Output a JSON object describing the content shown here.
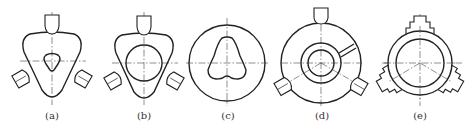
{
  "figure": {
    "panels": [
      {
        "id": "a",
        "label": "(a)",
        "description": "Rounded triangular workpiece with triangular hole held by three jaws"
      },
      {
        "id": "b",
        "label": "(b)",
        "description": "Rounded triangular workpiece with circular bore held by three jaws"
      },
      {
        "id": "c",
        "label": "(c)",
        "description": "Circular workpiece with pear-shaped cam profile"
      },
      {
        "id": "d",
        "label": "(d)",
        "description": "Circular ring workpiece with concentric bore and radial slot held by three jaws"
      },
      {
        "id": "e",
        "label": "(e)",
        "description": "Circular ring workpiece held by three stepped jaws"
      }
    ],
    "colors": {
      "line": "#222222",
      "background": "#ffffff"
    }
  }
}
